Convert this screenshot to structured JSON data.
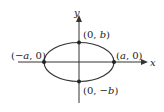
{
  "diagram": {
    "type": "ellipse",
    "axes": {
      "x_label": "x",
      "y_label": "y"
    },
    "points": [
      {
        "id": "top",
        "label_open": "(0, ",
        "label_var": "b",
        "label_close": ")"
      },
      {
        "id": "bottom",
        "label_open": "(0, −",
        "label_var": "b",
        "label_close": ")"
      },
      {
        "id": "left",
        "label_open": "(−",
        "label_var": "a",
        "label_close": ", 0)"
      },
      {
        "id": "right",
        "label_open": "(",
        "label_var": "a",
        "label_close": ", 0)"
      }
    ],
    "colors": {
      "stroke": "#333333",
      "background": "#ffffff"
    }
  }
}
